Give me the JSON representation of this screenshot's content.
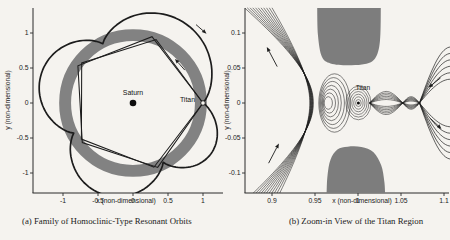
{
  "figure": {
    "background": "#f5f3ef",
    "ink": "#1c1c1c",
    "ring_gray": "#828282",
    "forbidden_gray": "#7d7d7d"
  },
  "chart_data": [
    {
      "type": "line",
      "id": "a",
      "caption": "(a) Family of Homoclinic-Type Resonant Orbits",
      "xlabel": "x (non-dimensional)",
      "ylabel": "y (non-dimensional)",
      "xlim": [
        -1.4286,
        1.2857
      ],
      "ylim": [
        -1.2857,
        1.3571
      ],
      "xtick_values": [
        -1,
        -0.5,
        0,
        0.5,
        1
      ],
      "xtick_labels": [
        "-1",
        "-0.5",
        "0",
        "0.5",
        "1"
      ],
      "ytick_values": [
        -1,
        -0.5,
        0,
        0.5,
        1
      ],
      "ytick_labels": [
        "-1",
        "-0.5",
        "0",
        "-0.5",
        "-1"
      ],
      "grid": false,
      "legend": null,
      "bodies": [
        {
          "name": "Saturn",
          "x": 0,
          "y": 0
        },
        {
          "name": "Titan",
          "x": 1,
          "y": 0
        }
      ],
      "ring": {
        "r_inner": 0.885,
        "r_outer": 1.055
      },
      "rosette": {
        "pinch_angles_deg": [
          0,
          117,
          207,
          297,
          360
        ],
        "pinch_radii": [
          1.0,
          0.95,
          0.95,
          0.95,
          1.0
        ],
        "petal_max_radii": [
          1.36,
          1.375,
          1.375,
          1.33
        ]
      },
      "pentagons": [
        {
          "vertices_deg_r": [
            [
              0,
              1.0
            ],
            [
              70,
              0.965
            ],
            [
              142,
              0.93
            ],
            [
              215,
              0.9
            ],
            [
              288,
              0.965
            ]
          ]
        },
        {
          "vertices_deg_r": [
            [
              0,
              1.0
            ],
            [
              74,
              0.985
            ],
            [
              146,
              0.95
            ],
            [
              218,
              0.92
            ],
            [
              291,
              0.985
            ]
          ]
        }
      ],
      "arrows": [
        {
          "tail": [
            0.9,
            1.12
          ],
          "head": [
            1.05,
            0.99
          ]
        },
        {
          "tail": [
            0.74,
            0.47
          ],
          "head": [
            0.6,
            0.63
          ]
        }
      ]
    },
    {
      "type": "line",
      "id": "b",
      "caption": "(b) Zoom-in View of the Titan Region",
      "xlabel": "x (non-dimensional)",
      "ylabel": "y (non-dimensional)",
      "xlim": [
        0.8686,
        1.1058
      ],
      "ylim": [
        -0.1286,
        0.1357
      ],
      "xtick_values": [
        0.9,
        0.95,
        1,
        1.05,
        1.1
      ],
      "xtick_labels": [
        "0.9",
        "0.95",
        "1",
        "1.05",
        "1.1"
      ],
      "ytick_values": [
        -0.1,
        -0.05,
        0,
        0.05,
        0.1
      ],
      "ytick_labels": [
        "-0.1",
        "-0.05",
        "0",
        "0.05",
        "0.1"
      ],
      "grid": false,
      "legend": null,
      "bodies": [
        {
          "name": "Titan",
          "x": 1.0005,
          "y": 0
        }
      ],
      "forbidden_regions": [
        {
          "points": [
            [
              0.9525,
              0.1357
            ],
            [
              0.9535,
              0.096
            ],
            [
              0.958,
              0.066
            ],
            [
              0.968,
              0.0565
            ],
            [
              0.988,
              0.054
            ],
            [
              1.008,
              0.0555
            ],
            [
              1.02,
              0.064
            ],
            [
              1.0255,
              0.088
            ],
            [
              1.0265,
              0.1357
            ]
          ]
        },
        {
          "points": [
            [
              0.9635,
              -0.1286
            ],
            [
              0.9645,
              -0.104
            ],
            [
              0.968,
              -0.081
            ],
            [
              0.976,
              -0.0665
            ],
            [
              0.988,
              -0.0625
            ],
            [
              1.004,
              -0.063
            ],
            [
              1.018,
              -0.0705
            ],
            [
              1.027,
              -0.089
            ],
            [
              1.0305,
              -0.111
            ],
            [
              1.0315,
              -0.1286
            ]
          ]
        }
      ],
      "manifold_fan": {
        "count": 11,
        "saddle_x": 0.948,
        "bottom_start_x": 0.872,
        "bottom_dx": 0.0034,
        "top_end_x": 0.868,
        "top_dx": 0.0032,
        "y_extent": 0.136
      },
      "lens_loops": {
        "cx": 0.9655,
        "cy": 0,
        "count": 7,
        "rx0": 0.0048,
        "drx": 0.00225,
        "ry0": 0.009,
        "dry": 0.00545
      },
      "titan_loops": {
        "cx": 1.0005,
        "cy": 0,
        "count": 6,
        "rx0": 0.0032,
        "drx": 0.00226,
        "ry0": 0.005,
        "dry": 0.0038
      },
      "braid_segments": [
        {
          "x1": 1.0135,
          "x2": 1.052,
          "amp": 0.0165,
          "count": 6
        },
        {
          "x1": 1.052,
          "x2": 1.0715,
          "amp": 0.009,
          "count": 6
        }
      ],
      "tails": {
        "x1": 1.0715,
        "x2": 1.108,
        "count": 6,
        "s0": 0.034,
        "ds": 0.0092
      },
      "arrows": [
        {
          "tail": [
            0.906,
            0.052
          ],
          "head": [
            0.894,
            0.08
          ]
        },
        {
          "tail": [
            0.896,
            -0.086
          ],
          "head": [
            0.908,
            -0.058
          ]
        },
        {
          "tail": [
            1.096,
            0.036
          ],
          "head": [
            1.082,
            0.022
          ]
        },
        {
          "tail": [
            1.084,
            -0.022
          ],
          "head": [
            1.097,
            -0.037
          ]
        }
      ]
    }
  ]
}
